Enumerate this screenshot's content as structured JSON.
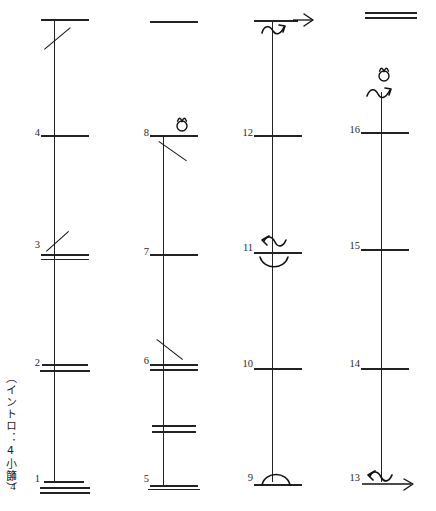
{
  "document": {
    "kind": "guitar-strumming-pattern-chart",
    "caption_vertical": "（イントロ：4小節）",
    "time_signature": {
      "numerator": "4",
      "denominator": "4"
    },
    "reading_order": "bottom-to-top, left-to-right"
  },
  "columns": [
    {
      "id": "column-1",
      "measures": [
        {
          "number": "1",
          "barline": "triple",
          "stroke": "none",
          "mark": "none"
        },
        {
          "number": "2",
          "barline": "double",
          "stroke": "none",
          "mark": "none"
        },
        {
          "number": "3",
          "barline": "double",
          "stroke": "up-slash",
          "mark": "none"
        },
        {
          "number": "4",
          "barline": "single",
          "stroke": "none",
          "mark": "none"
        }
      ],
      "top_barline": "single",
      "top_stroke": "up-slash"
    },
    {
      "id": "column-2",
      "measures": [
        {
          "number": "5",
          "barline": "double",
          "stroke": "none",
          "mark": "none"
        },
        {
          "number": "",
          "barline": "double",
          "stroke": "none",
          "mark": "none"
        },
        {
          "number": "6",
          "barline": "double",
          "stroke": "down-slash",
          "mark": "none"
        },
        {
          "number": "7",
          "barline": "single",
          "stroke": "none",
          "mark": "none"
        },
        {
          "number": "8",
          "barline": "single",
          "stroke": "down-slash",
          "mark": "ornament-loop"
        }
      ],
      "top_barline": "single",
      "top_stroke": "none"
    },
    {
      "id": "column-3",
      "measures": [
        {
          "number": "9",
          "barline": "single",
          "stroke": "none",
          "mark": "arc-up"
        },
        {
          "number": "10",
          "barline": "single",
          "stroke": "none",
          "mark": "none"
        },
        {
          "number": "11",
          "barline": "single",
          "stroke": "none",
          "mark": "wave-left-arrow + arc-down"
        },
        {
          "number": "12",
          "barline": "single",
          "stroke": "none",
          "mark": "none"
        }
      ],
      "top_barline": "single",
      "top_stroke": "none",
      "top_mark": "wave-right-arrow"
    },
    {
      "id": "column-4",
      "measures": [
        {
          "number": "13",
          "barline": "single",
          "stroke": "none",
          "mark": "wave-left-arrow + right-arrow"
        },
        {
          "number": "14",
          "barline": "single",
          "stroke": "none",
          "mark": "none"
        },
        {
          "number": "15",
          "barline": "single",
          "stroke": "none",
          "mark": "none"
        },
        {
          "number": "16",
          "barline": "single",
          "stroke": "none",
          "mark": "none"
        }
      ],
      "top_barline": "double",
      "top_stroke": "none",
      "top_mark": "ornament-loop + wave-right-arrow"
    }
  ],
  "measure_numbers": {
    "n1": "1",
    "n2": "2",
    "n3": "3",
    "n4": "4",
    "n5": "5",
    "n6": "6",
    "n7": "7",
    "n8": "8",
    "n9": "9",
    "n10": "10",
    "n11": "11",
    "n12": "12",
    "n13": "13",
    "n14": "14",
    "n15": "15",
    "n16": "16"
  },
  "colors": {
    "ink": "#222222",
    "paper": "#ffffff"
  }
}
